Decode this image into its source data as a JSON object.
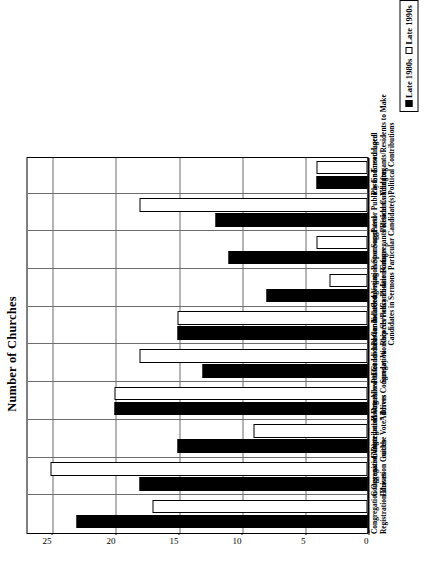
{
  "chart_data": {
    "type": "bar",
    "title": "",
    "xlabel": "",
    "ylabel": "Number of Churches",
    "ylim": [
      0,
      27
    ],
    "yticks": [
      0,
      5,
      10,
      15,
      20,
      25
    ],
    "grid": true,
    "orientation": "vertical-bars-rotated-page",
    "legend_position": "right",
    "categories": [
      "Congregation Organized Voter Registration Drives",
      "Congregation Distributed Voter Education Guides",
      "Congregation Organized “Get out the Vote” Drives",
      "Pastor Allowed Candidates to Address Congregation",
      "Pastor Invited Candidates to Sunday Worship Services",
      "Pastor Included Voting Records/Policy Positions of Candidates in Sermons",
      "Congregation Sponsored Candidate Forums",
      "Pastor Suggested Congregants/Residents Vote for Particular Candidate(s)",
      "Pastor Publicly Endorsed Local Political Candidates",
      "Pastor Encouraged Congregants/Residents to Make Political Contributions"
    ],
    "category_lines": [
      [
        "Congregation Organized Voter",
        "Registration Drives"
      ],
      [
        "Congregation Distributed Voter",
        "Education Guides"
      ],
      [
        "Congregation Organized “Get",
        "out the Vote” Drives"
      ],
      [
        "Pastor Allowed Candidates to",
        "Address Congregation"
      ],
      [
        "Pastor Invited Candidates to",
        "Sunday Worship Services"
      ],
      [
        "Pastor Included Voting",
        "Records/Policy Positions of",
        "Candidates in Sermons"
      ],
      [
        "Congregation Sponsored",
        "Candidate Forums"
      ],
      [
        "Pastor Suggested",
        "Congregants/Residents Vote for",
        "Particular Candidate(s)"
      ],
      [
        "Pastor Publicly Endorsed Local",
        "Political Candidates"
      ],
      [
        "Pastor Encouraged",
        "Congregants/Residents to Make",
        "Political Contributions"
      ]
    ],
    "series": [
      {
        "name": "Late 1980s",
        "color": "#000000",
        "style": "filled",
        "values": [
          23,
          18,
          15,
          20,
          13,
          15,
          8,
          11,
          12,
          4
        ]
      },
      {
        "name": "Late 1990s",
        "color": "#ffffff",
        "style": "outline",
        "values": [
          17,
          25,
          9,
          20,
          18,
          15,
          3,
          4,
          18,
          4
        ]
      }
    ]
  },
  "axis": {
    "value_axis_title": "Number of Churches",
    "tick_labels": [
      "0",
      "5",
      "10",
      "15",
      "20",
      "25"
    ]
  },
  "legend": {
    "entries": [
      {
        "label": "Late 1980s",
        "swatch": "filled-square-icon"
      },
      {
        "label": "Late 1990s",
        "swatch": "hollow-square-icon"
      }
    ]
  }
}
